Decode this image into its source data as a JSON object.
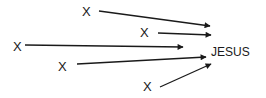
{
  "diagram": {
    "target": {
      "label": "JESUS",
      "x": 211,
      "y": 46
    },
    "sources": [
      {
        "label": "X",
        "x": 82,
        "y": 5,
        "arrow": [
          99,
          11,
          210,
          26
        ]
      },
      {
        "label": "X",
        "x": 140,
        "y": 26,
        "arrow": [
          158,
          33,
          211,
          35
        ]
      },
      {
        "label": "X",
        "x": 13,
        "y": 40,
        "arrow": [
          25,
          45,
          183,
          47
        ]
      },
      {
        "label": "X",
        "x": 58,
        "y": 60,
        "arrow": [
          77,
          64,
          206,
          57
        ]
      },
      {
        "label": "X",
        "x": 143,
        "y": 80,
        "arrow": [
          160,
          87,
          211,
          64
        ]
      }
    ],
    "color": "#1a1a1a"
  }
}
